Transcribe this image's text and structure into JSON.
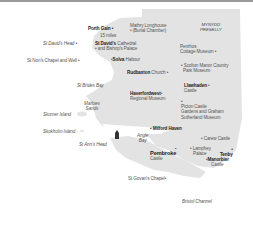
{
  "map": {
    "colors": {
      "land": "#e3e3e3",
      "sea": "#ffffff",
      "text": "#333333",
      "marker": "#333333"
    },
    "region": {
      "name": "MYNYDD\nPRESELLY",
      "line1": "MYNYDD",
      "line2": "PRESELLY"
    },
    "scale": {
      "label": "15 miles"
    },
    "places": [
      {
        "id": "porth-gain",
        "label": "Porth Gain"
      },
      {
        "id": "mathry",
        "line1": "Mathry Longhouse",
        "line2": "(Burial Chamber)"
      },
      {
        "id": "st-davids-head",
        "label": "St David's Head"
      },
      {
        "id": "st-davids-cathedral",
        "line1": "St David's Cathedral",
        "line2": "and Bishop's Palace",
        "bold_part": "St David's"
      },
      {
        "id": "st-nons",
        "label": "St Non's Chapel and Well"
      },
      {
        "id": "solva",
        "label": "Solva",
        "suffix": "Habour"
      },
      {
        "id": "penrhos",
        "line1": "Penrhos",
        "line2": "Cottage Museum"
      },
      {
        "id": "scolton",
        "line1": "Scolton Manor Country",
        "line2": "Park Museum"
      },
      {
        "id": "rudbaxton",
        "label": "Rudbaxton",
        "suffix": "Church"
      },
      {
        "id": "st-brides-bay",
        "label": "St Brides Bay"
      },
      {
        "id": "llawhaden",
        "line1": "Llawhaden",
        "line2": "Castle"
      },
      {
        "id": "haverfordwest",
        "line1": "Haverfordwest",
        "line2": "Regional Museum"
      },
      {
        "id": "marloes",
        "line1": "Marloes",
        "line2": "Sands"
      },
      {
        "id": "skomer",
        "label": "Skomer Island"
      },
      {
        "id": "picton",
        "line1": "Picton Castle",
        "line2": "Gardens and Graham",
        "line3": "Sutherland Museum"
      },
      {
        "id": "skokholm",
        "label": "Skokholm Island"
      },
      {
        "id": "milford-haven",
        "label": "Milford Haven"
      },
      {
        "id": "angle-bay",
        "line1": "Angle",
        "line2": "Bay"
      },
      {
        "id": "st-anns-head",
        "label": "St Ann's Head"
      },
      {
        "id": "carew",
        "label": "Carew Castle"
      },
      {
        "id": "pembroke",
        "line1": "Pembroke",
        "line2": "Castle"
      },
      {
        "id": "lamphey",
        "line1": "Lamphey",
        "line2": "Palace"
      },
      {
        "id": "tenby",
        "label": "Tenby"
      },
      {
        "id": "manorbier",
        "line1": "Manorbier",
        "line2": "Castle"
      },
      {
        "id": "st-govans",
        "label": "St Govan's Chapel"
      },
      {
        "id": "bristol-channel",
        "label": "Bristol Channel"
      }
    ]
  }
}
